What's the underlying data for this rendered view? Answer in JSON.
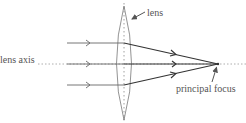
{
  "diagram": {
    "labels": {
      "lens": "lens",
      "lens_axis": "lens axis",
      "principal_focus": "principal focus"
    },
    "rays": [
      {
        "name": "top-ray",
        "y_in": 43
      },
      {
        "name": "axis-ray",
        "y_in": 64
      },
      {
        "name": "bottom-ray",
        "y_in": 85
      }
    ],
    "colors": {
      "ray": "#333333",
      "lens": "#777777",
      "axis": "#999999",
      "text": "#555555"
    }
  }
}
